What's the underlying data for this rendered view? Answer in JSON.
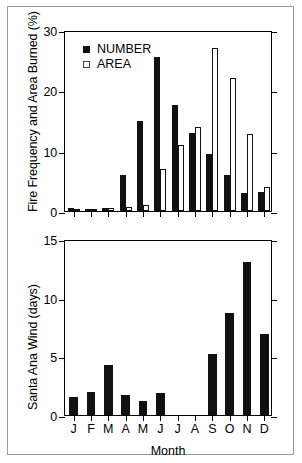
{
  "figure": {
    "title": "",
    "panels": [
      "fire-frequency-area-burned",
      "santa-ana-wind"
    ]
  },
  "legend": {
    "items": [
      {
        "label": "NUMBER",
        "style": "filled",
        "color": "#111111"
      },
      {
        "label": "AREA",
        "style": "open",
        "color": "#ffffff"
      }
    ]
  },
  "chart_data": [
    {
      "type": "bar",
      "id": "fire-frequency-area-burned",
      "title": "",
      "xlabel": "",
      "ylabel": "Fire Frequency and Area Burned (%)",
      "categories": [
        "J",
        "F",
        "M",
        "A",
        "M",
        "J",
        "J",
        "A",
        "S",
        "O",
        "N",
        "D"
      ],
      "ylim": [
        0,
        30
      ],
      "yticks": [
        0,
        10,
        20,
        30
      ],
      "grid": false,
      "legend_position": "top-left",
      "series": [
        {
          "name": "NUMBER",
          "style": "filled",
          "values": [
            0.5,
            0.4,
            0.5,
            6.0,
            15.0,
            25.5,
            17.5,
            13.0,
            9.5,
            6.0,
            3.0,
            3.1
          ]
        },
        {
          "name": "AREA",
          "style": "open",
          "values": [
            0.1,
            0.1,
            0.5,
            0.7,
            1.0,
            7.0,
            11.0,
            14.0,
            27.0,
            22.0,
            12.7,
            4.0
          ]
        }
      ]
    },
    {
      "type": "bar",
      "id": "santa-ana-wind",
      "title": "",
      "xlabel": "Month",
      "ylabel": "Santa Ana Wind (days)",
      "categories": [
        "J",
        "F",
        "M",
        "A",
        "M",
        "J",
        "J",
        "A",
        "S",
        "O",
        "N",
        "D"
      ],
      "ylim": [
        0,
        15
      ],
      "yticks": [
        0,
        5,
        10,
        15
      ],
      "grid": false,
      "legend_position": "none",
      "series": [
        {
          "name": "Santa Ana Wind",
          "style": "filled",
          "values": [
            1.5,
            2.0,
            4.3,
            1.7,
            1.2,
            1.9,
            0.0,
            0.0,
            5.2,
            8.7,
            13.0,
            6.9
          ]
        }
      ]
    }
  ]
}
